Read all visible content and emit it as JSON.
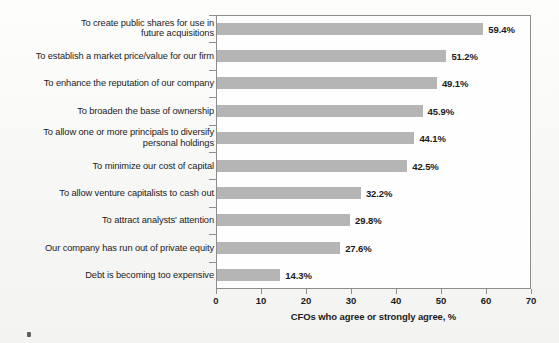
{
  "chart_data": {
    "type": "bar",
    "orientation": "horizontal",
    "title": "",
    "xlabel": "CFOs who agree or strongly agree, %",
    "ylabel": "",
    "xlim": [
      0,
      70
    ],
    "xticks": [
      0,
      10,
      20,
      30,
      40,
      50,
      60,
      70
    ],
    "grid": false,
    "legend": null,
    "bar_color": "#b5b5b5",
    "categories": [
      "To create public shares for use in\nfuture acquisitions",
      "To establish a market price/value for our firm",
      "To enhance the reputation of our company",
      "To broaden the base of ownership",
      "To allow one or more principals to diversify\npersonal holdings",
      "To minimize our cost of capital",
      "To allow venture capitalists to cash out",
      "To attract analysts' attention",
      "Our company has run out of private equity",
      "Debt is becoming too expensive"
    ],
    "values": [
      59.4,
      51.2,
      49.1,
      45.9,
      44.1,
      42.5,
      32.2,
      29.8,
      27.6,
      14.3
    ],
    "value_labels": [
      "59.4%",
      "51.2%",
      "49.1%",
      "45.9%",
      "44.1%",
      "42.5%",
      "32.2%",
      "29.8%",
      "27.6%",
      "14.3%"
    ]
  }
}
